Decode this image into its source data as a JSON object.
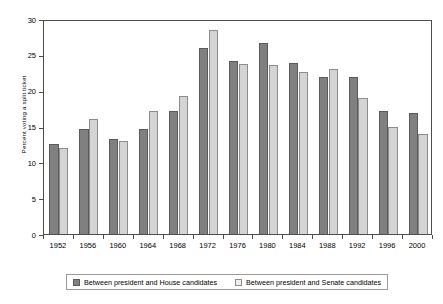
{
  "chart_data": {
    "type": "bar",
    "title": "",
    "xlabel": "",
    "ylabel": "Percent voting a split ticket",
    "ylim": [
      0,
      30
    ],
    "yticks": [
      0,
      5,
      10,
      15,
      20,
      25,
      30
    ],
    "grid": false,
    "legend_position": "bottom",
    "categories": [
      "1952",
      "1956",
      "1960",
      "1964",
      "1968",
      "1972",
      "1976",
      "1980",
      "1984",
      "1988",
      "1992",
      "1996",
      "2000"
    ],
    "series": [
      {
        "name": "Between president and House candidates",
        "color": "#808080",
        "values": [
          12.6,
          14.6,
          13.2,
          14.6,
          17.2,
          25.9,
          24.1,
          26.6,
          23.9,
          21.9,
          21.9,
          17.2,
          16.9
        ]
      },
      {
        "name": "Between president and Senate candidates",
        "color": "#d4d4d4",
        "values": [
          12.0,
          16.1,
          13.0,
          17.1,
          19.2,
          28.4,
          23.7,
          23.6,
          22.6,
          23.0,
          19.0,
          14.9,
          14.0
        ]
      }
    ]
  },
  "legend": {
    "items": [
      {
        "label": "Between president and House candidates"
      },
      {
        "label": "Between president and Senate candidates"
      }
    ]
  }
}
